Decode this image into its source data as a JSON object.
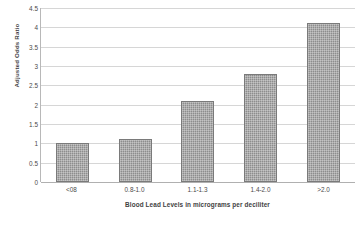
{
  "chart_data": {
    "type": "bar",
    "title": "",
    "xlabel": "Blood Lead Levels in micrograms per deciliter",
    "ylabel": "Adjusted Odds Ratio",
    "categories": [
      "<08",
      "0.8-1.0",
      "1.1-1.3",
      "1.4-2.0",
      ">2.0"
    ],
    "values": [
      1.0,
      1.1,
      2.1,
      2.8,
      4.1
    ],
    "ylim": [
      0,
      4.5
    ],
    "ytick_labels": [
      "4.5",
      "4",
      "3.5",
      "3",
      "2.5",
      "2",
      "1.5",
      "1",
      "0.5",
      "0"
    ],
    "ytick_values": [
      4.5,
      4,
      3.5,
      3,
      2.5,
      2,
      1.5,
      1,
      0.5,
      0
    ],
    "grid": true,
    "legend": false,
    "legend_position": "none",
    "series": [
      {
        "name": "Adjusted Odds Ratio",
        "values": [
          1.0,
          1.1,
          2.1,
          2.8,
          4.1
        ],
        "color": "#8d8d8d"
      }
    ],
    "bar_fill_color": "#8d8d8d",
    "bar_border_color": "#7a7a7a",
    "gridline_color": "#d6d6d6",
    "axis_color": "#b0b0b0",
    "background_color": "#ffffff"
  }
}
